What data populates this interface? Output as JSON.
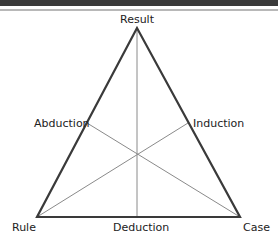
{
  "diagram": {
    "vertices": {
      "top": "Result",
      "bottom_left": "Rule",
      "bottom_right": "Case"
    },
    "sides": {
      "left": "Abduction",
      "right": "Induction",
      "bottom": "Deduction"
    },
    "colors": {
      "outline": "#3a3a3a",
      "medians": "#8a8a8a"
    }
  }
}
